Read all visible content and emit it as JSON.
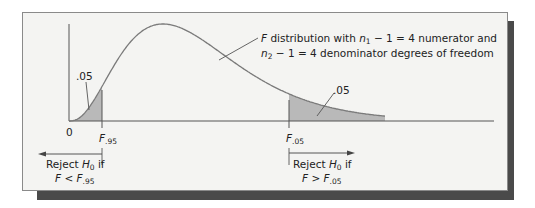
{
  "figure": {
    "curve_label_line1_prefix": "F",
    "curve_label_line1_text": " distribution with ",
    "curve_label_line1_var": "n",
    "curve_label_line1_sub": "1",
    "curve_label_line1_rest": " − 1 = 4 numerator and",
    "curve_label_line2_var": "n",
    "curve_label_line2_sub": "2",
    "curve_label_line2_rest": " − 1 = 4 denominator degrees of freedom",
    "left_tail_area": ".05",
    "right_tail_area": ".05",
    "origin_label": "0",
    "left_crit_var": "F",
    "left_crit_sub": ".95",
    "right_crit_var": "F",
    "right_crit_sub": ".05",
    "left_reject_line1": "Reject ",
    "left_reject_H": "H",
    "left_reject_Hsub": "0",
    "left_reject_if": " if",
    "left_reject_line2_var": "F",
    "left_reject_line2_op": " < ",
    "left_reject_line2_crit": "F",
    "left_reject_line2_sub": ".95",
    "right_reject_line1": "Reject ",
    "right_reject_H": "H",
    "right_reject_Hsub": "0",
    "right_reject_if": " if",
    "right_reject_line2_var": "F",
    "right_reject_line2_op": " > ",
    "right_reject_line2_crit": "F",
    "right_reject_line2_sub": ".05",
    "shade_color": "#b9b9b9",
    "curve_color": "#7a7a7a"
  },
  "chart_data": {
    "type": "area",
    "distribution": "F",
    "df_numerator": 4,
    "df_denominator": 4,
    "alpha_left": 0.05,
    "alpha_right": 0.05,
    "critical_values": {
      "F.95": 0.156,
      "F.05": 6.39
    },
    "xlabel": "",
    "ylabel": "",
    "tick_labels": [
      "0",
      "F.95",
      "F.05"
    ],
    "annotations": [
      ".05",
      ".05",
      "Reject H0 if F < F.95",
      "Reject H0 if F > F.05"
    ]
  }
}
